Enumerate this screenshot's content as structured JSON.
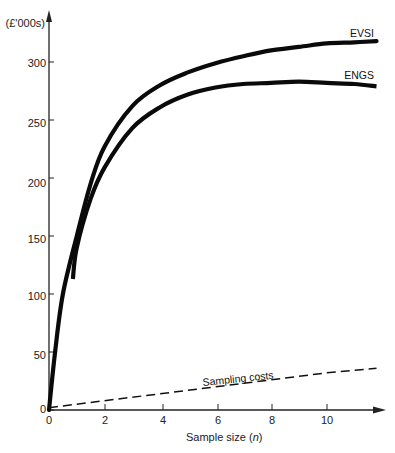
{
  "chart_data": {
    "type": "line",
    "title": "",
    "xlabel": "Sample size (n)",
    "ylabel": "(£'000s)",
    "xlim": [
      0,
      12
    ],
    "ylim": [
      0,
      320
    ],
    "x_ticks": [
      0,
      2,
      4,
      6,
      8,
      10
    ],
    "y_ticks": [
      0,
      50,
      100,
      150,
      200,
      250,
      300
    ],
    "grid": false,
    "legend": "inline labels at right end of curves",
    "series": [
      {
        "name": "EVSI",
        "style": "solid-thick",
        "x": [
          0,
          0.22,
          0.5,
          1,
          1.5,
          2,
          3,
          4,
          5,
          6,
          7,
          8,
          9,
          10,
          11,
          11.8
        ],
        "values": [
          0,
          50,
          100,
          150,
          195,
          227,
          262,
          280,
          291,
          299,
          305,
          310,
          313,
          316,
          317,
          318
        ]
      },
      {
        "name": "ENGS",
        "style": "solid-thick",
        "x": [
          0.86,
          1,
          1.5,
          2,
          3,
          4,
          5,
          6,
          7,
          8,
          9,
          10,
          11,
          11.8
        ],
        "values": [
          113,
          140,
          182,
          209,
          243,
          261,
          272,
          278,
          281,
          282,
          283,
          282,
          281,
          279
        ]
      },
      {
        "name": "Sampling costs",
        "style": "dashed",
        "x": [
          0,
          2,
          4,
          6,
          8,
          10,
          11.8
        ],
        "values": [
          2,
          8,
          14,
          20,
          26,
          32,
          36
        ]
      }
    ]
  },
  "labels": {
    "y_unit": "(£'000s)",
    "x_title_prefix": "Sample size (",
    "x_title_var": "n",
    "x_title_suffix": ")",
    "evsi": "EVSI",
    "engs": "ENGS",
    "sampling_costs": "Sampling costs",
    "y_ticks": [
      "0",
      "50",
      "100",
      "150",
      "200",
      "250",
      "300"
    ],
    "x_ticks": [
      "0",
      "2",
      "4",
      "6",
      "8",
      "10"
    ]
  }
}
